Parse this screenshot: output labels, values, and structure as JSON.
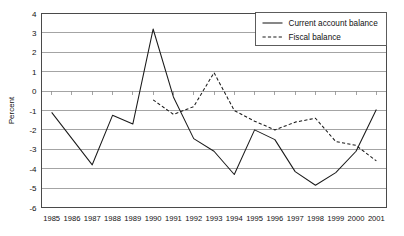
{
  "chart_data": {
    "type": "line",
    "title": "",
    "xlabel": "",
    "ylabel": "Percent",
    "grid": true,
    "legend_position": "top-right",
    "ylim": [
      -6,
      4
    ],
    "yticks": [
      4,
      3,
      2,
      1,
      0,
      -1,
      -2,
      -3,
      -4,
      -5,
      -6
    ],
    "ytick_labels": [
      "4",
      "3",
      "2",
      "1",
      "0",
      "-1",
      "-2",
      "-3",
      "-4",
      "-5",
      "-6"
    ],
    "categories": [
      "1985",
      "1986",
      "1987",
      "1988",
      "1989",
      "1990",
      "1991",
      "1992",
      "1993",
      "1994",
      "1995",
      "1996",
      "1997",
      "1998",
      "1999",
      "2000",
      "2001"
    ],
    "x": [
      1985,
      1986,
      1987,
      1988,
      1989,
      1990,
      1991,
      1992,
      1993,
      1994,
      1995,
      1996,
      1997,
      1998,
      1999,
      2000,
      2001
    ],
    "series": [
      {
        "name": "Current account balance",
        "style": "solid",
        "color": "#1a1a1a",
        "values": [
          -1.1,
          -2.45,
          -3.8,
          -1.25,
          -1.7,
          3.2,
          -0.3,
          -2.45,
          -3.1,
          -4.3,
          -2.0,
          -2.5,
          -4.15,
          -4.85,
          -4.2,
          -3.1,
          -0.95
        ]
      },
      {
        "name": "Fiscal balance",
        "style": "dashed",
        "color": "#1a1a1a",
        "values": [
          null,
          null,
          null,
          null,
          null,
          -0.45,
          -1.2,
          -0.8,
          0.95,
          -1.0,
          -1.55,
          -2.0,
          -1.6,
          -1.4,
          -2.6,
          -2.8,
          -3.6
        ]
      }
    ]
  },
  "legend": {
    "entries": [
      {
        "label": "Current account balance",
        "style": "solid"
      },
      {
        "label": "Fiscal balance",
        "style": "dashed"
      }
    ]
  }
}
